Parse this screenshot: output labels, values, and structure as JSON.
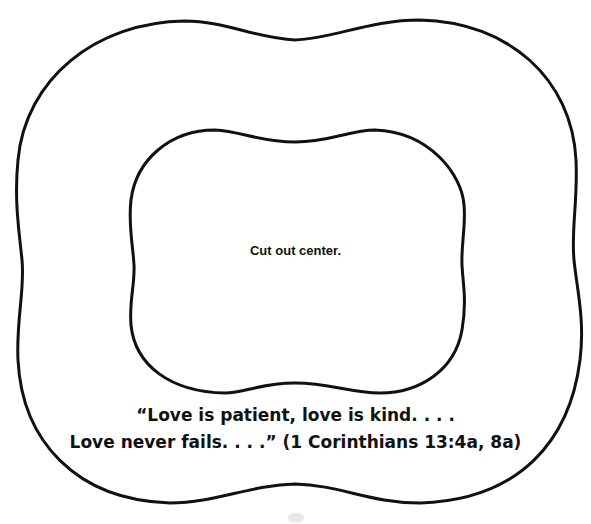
{
  "instruction": "Cut out center.",
  "verse": {
    "line1": "“Love is patient, love is kind. . . .",
    "line2": "Love never fails. . . .” (1 Corinthians 13:4a, 8a)"
  },
  "colors": {
    "outline": "#111111",
    "background": "#ffffff"
  }
}
